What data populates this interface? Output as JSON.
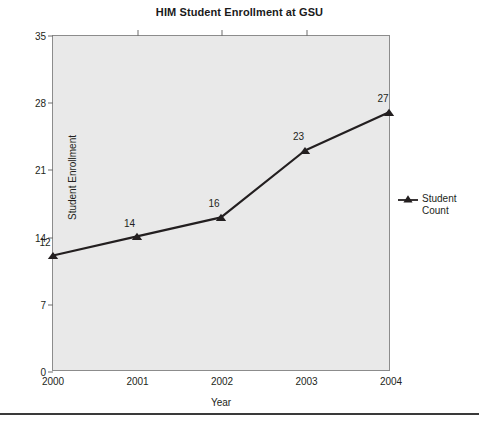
{
  "chart_data": {
    "type": "line",
    "title": "HIM Student Enrollment at GSU",
    "xlabel": "Year",
    "ylabel": "Student Enrollment",
    "categories": [
      "2000",
      "2001",
      "2002",
      "2003",
      "2004"
    ],
    "values": [
      12,
      14,
      16,
      23,
      27
    ],
    "point_labels": [
      "12",
      "14",
      "16",
      "23",
      "27"
    ],
    "yticks": [
      "0",
      "7",
      "14",
      "21",
      "28",
      "35"
    ],
    "ytick_values": [
      0,
      7,
      14,
      21,
      28,
      35
    ],
    "ylim": [
      0,
      35
    ],
    "xlim": [
      "2000",
      "2004"
    ],
    "grid": false,
    "legend": {
      "position": "right",
      "entries": [
        {
          "name": "Student Count",
          "line1": "Student",
          "line2": "Count",
          "marker": "triangle",
          "color": "#231f20"
        }
      ]
    },
    "series": [
      {
        "name": "Student Count",
        "values": [
          12,
          14,
          16,
          23,
          27
        ],
        "color": "#231f20",
        "marker": "triangle"
      }
    ],
    "colors": {
      "plot_background": "#e9e9e9",
      "page_background": "#ffffff",
      "axis": "#8c8c8c",
      "line": "#231f20",
      "text": "#231f20"
    }
  },
  "footer": {
    "note": ""
  }
}
